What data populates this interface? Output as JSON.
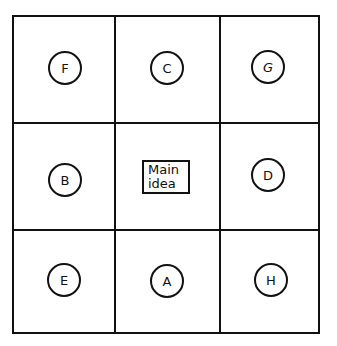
{
  "diagram": {
    "type": "3x3 graphic organizer grid",
    "center": {
      "line1": "Main",
      "line2": "idea"
    },
    "nodes": [
      {
        "label": "F",
        "row": 0,
        "col": 0
      },
      {
        "label": "C",
        "row": 0,
        "col": 1
      },
      {
        "label": "G",
        "row": 0,
        "col": 2
      },
      {
        "label": "B",
        "row": 1,
        "col": 0
      },
      {
        "label": "D",
        "row": 1,
        "col": 2
      },
      {
        "label": "E",
        "row": 2,
        "col": 0
      },
      {
        "label": "A",
        "row": 2,
        "col": 1
      },
      {
        "label": "H",
        "row": 2,
        "col": 2
      }
    ]
  }
}
